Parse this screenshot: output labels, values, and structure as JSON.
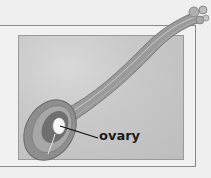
{
  "diagram": {
    "labels": [
      {
        "text": "ovary",
        "target": "ovary"
      }
    ],
    "colors": {
      "background": "#efefef",
      "panel": "#c6c6c6",
      "pistil_outer": "#8e8e8e",
      "pistil_inner": "#6e6e6e",
      "ovule": "#ffffff",
      "leader_line": "#111111"
    }
  }
}
